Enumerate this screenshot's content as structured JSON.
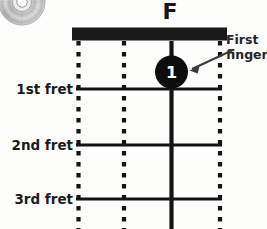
{
  "diagram": {
    "type": "guitar-chord-diagram",
    "chord_name": "F",
    "instrument_strings": 4,
    "fret_labels": [
      {
        "id": "fret-1",
        "label": "1st fret"
      },
      {
        "id": "fret-2",
        "label": "2nd fret"
      },
      {
        "id": "fret-3",
        "label": "3rd fret"
      }
    ],
    "annotation": {
      "line1": "First",
      "line2": "finger",
      "points_to": "finger-dot-1"
    },
    "finger_dots": [
      {
        "number": "1",
        "string": 3,
        "fret": 1
      }
    ],
    "colors": {
      "ink": "#151515",
      "nut": "#1a1a1a",
      "dot_fill": "#0d0d0d",
      "dot_text": "#ffffff",
      "background": "#fdfdfc",
      "disc_light": "#f2f2f2",
      "disc_mid": "#b9b9b9",
      "disc_dark": "#8c8c8c"
    }
  },
  "decoration": {
    "disc_icon": "cd-disc-icon"
  }
}
